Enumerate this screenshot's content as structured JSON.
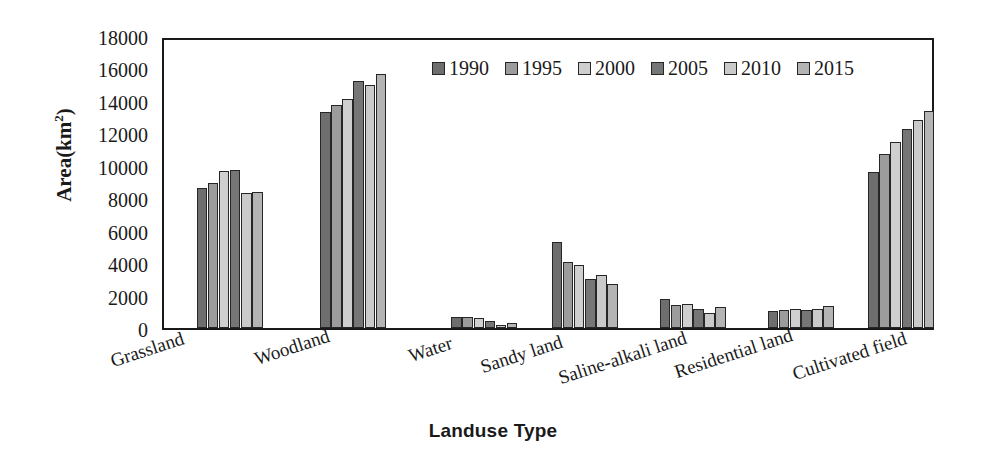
{
  "chart_data": {
    "type": "bar",
    "title": "",
    "xlabel": "Landuse Type",
    "ylabel": "Area(km2)",
    "ylabel_base": "Area(km",
    "ylabel_sup": "2",
    "ylabel_close": ")",
    "ylim": [
      0,
      18000
    ],
    "ytick_step": 2000,
    "yticks": [
      "18000",
      "16000",
      "14000",
      "12000",
      "10000",
      "8000",
      "6000",
      "4000",
      "2000",
      "0"
    ],
    "ytick_values": [
      18000,
      16000,
      14000,
      12000,
      10000,
      8000,
      6000,
      4000,
      2000,
      0
    ],
    "grid": false,
    "legend_position": "top-right",
    "categories": [
      "Grassland",
      "Woodland",
      "Water",
      "Sandy land",
      "Saline-alkali land",
      "Residential land",
      "Cultivated field"
    ],
    "series": [
      {
        "name": "1990",
        "color": "#6e6e6e",
        "values": [
          8650,
          13300,
          680,
          5300,
          1800,
          1030,
          9600
        ]
      },
      {
        "name": "1995",
        "color": "#9c9c9c",
        "values": [
          8950,
          13750,
          700,
          4050,
          1420,
          1080,
          10750
        ]
      },
      {
        "name": "2000",
        "color": "#cfcfcf",
        "values": [
          9650,
          14100,
          620,
          3900,
          1500,
          1150,
          11450
        ]
      },
      {
        "name": "2005",
        "color": "#767676",
        "values": [
          9750,
          15250,
          420,
          3000,
          1150,
          1080,
          12250
        ]
      },
      {
        "name": "2010",
        "color": "#cacaca",
        "values": [
          8350,
          14950,
          200,
          3250,
          900,
          1180,
          12850
        ]
      },
      {
        "name": "2015",
        "color": "#b4b4b4",
        "values": [
          8400,
          15650,
          280,
          2700,
          1300,
          1330,
          13400
        ]
      }
    ]
  },
  "axis": {
    "y_title_text": "Area(km",
    "y_title_sup": "2",
    "y_title_tail": ")",
    "x_title": "Landuse Type"
  },
  "legend": {
    "entries": [
      {
        "label": "1990"
      },
      {
        "label": "1995"
      },
      {
        "label": "2000"
      },
      {
        "label": "2005"
      },
      {
        "label": "2010"
      },
      {
        "label": "2015"
      }
    ]
  },
  "colors": {
    "axis": "#1a1a1a",
    "background": "#ffffff",
    "bar_outline": "#262626"
  }
}
